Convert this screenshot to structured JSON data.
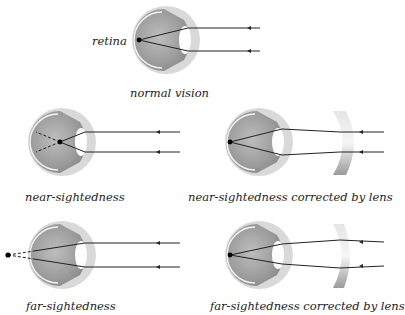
{
  "labels": {
    "retina": "retina",
    "normal": "normal vision",
    "near": "near-sightedness",
    "near_corrected": "near-sightedness corrected by lens",
    "far": "far-sightedness",
    "far_corrected": "far-sightedness corrected by lens"
  },
  "colors": {
    "eye_outer": "#c8c8c8",
    "eye_inner": "#9a9a9a",
    "ray": "#222222",
    "lens": "#bdbdbd"
  }
}
